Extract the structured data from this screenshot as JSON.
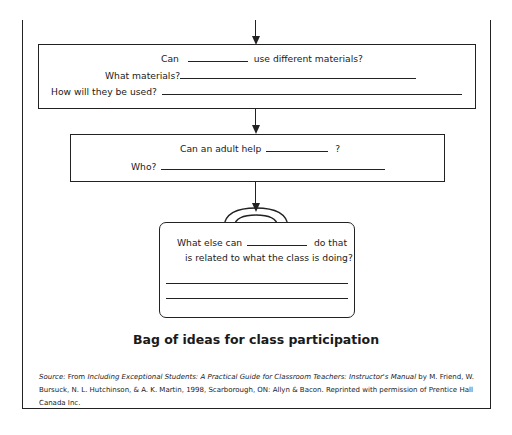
{
  "flowchart": {
    "box1": {
      "line1_prefix": "Can",
      "line1_suffix": "use different materials?",
      "line2_label": "What materials?",
      "line3_label": "How will they be used?"
    },
    "box2": {
      "line1_prefix": "Can an adult help",
      "line1_suffix": "?",
      "line2_label": "Who?"
    },
    "bag": {
      "line1_prefix": "What else can",
      "line1_suffix": "do that",
      "line2": "is related to what the class is doing?"
    }
  },
  "caption": "Bag of ideas for class participation",
  "source": {
    "label": "Source:",
    "from": "From",
    "title": "Including Exceptional Students: A Practical Guide for Classroom Teachers: Instructor's Manual",
    "rest": "by M. Friend, W. Bursuck, N. L. Hutchinson, & A. K. Martin, 1998, Scarborough, ON: Allyn & Bacon. Reprinted with permission of Prentice Hall Canada Inc."
  }
}
